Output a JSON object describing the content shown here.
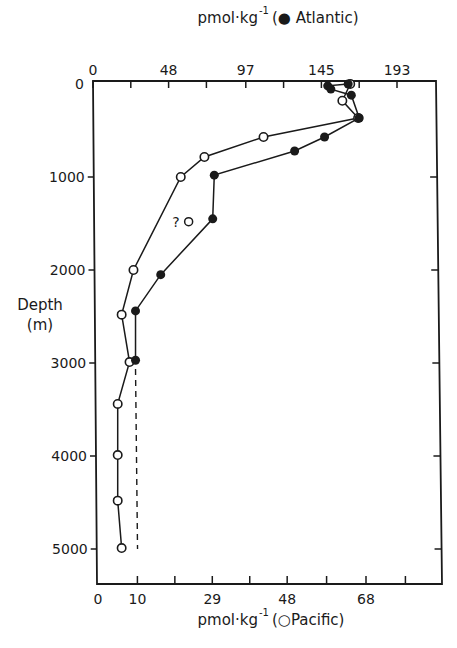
{
  "chart_data": {
    "type": "line",
    "title": "",
    "orientation": "vertical-profile",
    "top_axis": {
      "label": "pmol·kg⁻¹ (● Atlantic)",
      "label_prefix": "pmol·kg",
      "label_suffix": "(● Atlantic)",
      "ticks": [
        0,
        48,
        97,
        145,
        193
      ],
      "minor_ticks": [
        24,
        72,
        121,
        169
      ],
      "range": [
        0,
        220
      ]
    },
    "bottom_axis": {
      "label": "pmol·kg⁻¹ (○ Pacific)",
      "label_prefix": "pmol·kg",
      "label_suffix": "(○Pacific)",
      "ticks": [
        0,
        10,
        29,
        48,
        68
      ],
      "tick_positions": [
        0,
        10,
        19.5,
        29,
        38.5,
        48,
        58,
        68,
        78
      ],
      "range": [
        0,
        87
      ]
    },
    "y_axis": {
      "label": "Depth",
      "unit": "(m)",
      "ticks": [
        0,
        1000,
        2000,
        3000,
        4000,
        5000
      ],
      "range": [
        0,
        5400
      ],
      "inverted": true
    },
    "series": [
      {
        "name": "Atlantic",
        "marker": "filled-circle",
        "axis": "top",
        "points": [
          {
            "x": 162,
            "depth": 0
          },
          {
            "x": 149,
            "depth": 20
          },
          {
            "x": 151,
            "depth": 55
          },
          {
            "x": 164,
            "depth": 120
          },
          {
            "x": 169,
            "depth": 365
          },
          {
            "x": 147,
            "depth": 570
          },
          {
            "x": 128,
            "depth": 720
          },
          {
            "x": 77,
            "depth": 980
          },
          {
            "x": 76,
            "depth": 1450
          },
          {
            "x": 43,
            "depth": 2050
          },
          {
            "x": 27,
            "depth": 2440
          },
          {
            "x": 27,
            "depth": 2970
          }
        ]
      },
      {
        "name": "Pacific",
        "marker": "open-circle",
        "axis": "bottom",
        "points": [
          {
            "x": 64,
            "depth": 0
          },
          {
            "x": 62,
            "depth": 180
          },
          {
            "x": 66,
            "depth": 365
          },
          {
            "x": 42,
            "depth": 570
          },
          {
            "x": 27,
            "depth": 785
          },
          {
            "x": 21,
            "depth": 1000
          },
          {
            "x": 9,
            "depth": 2000
          },
          {
            "x": 6,
            "depth": 2480
          },
          {
            "x": 8,
            "depth": 2990
          },
          {
            "x": 5,
            "depth": 3440
          },
          {
            "x": 5,
            "depth": 3990
          },
          {
            "x": 5,
            "depth": 4480
          },
          {
            "x": 6,
            "depth": 4990
          }
        ]
      }
    ],
    "annotations": [
      {
        "text": "?",
        "marker": "open-circle",
        "series": "Pacific",
        "x": 23,
        "depth": 1480,
        "note": "questionable Pacific point"
      },
      {
        "type": "dashed-line",
        "series": "Atlantic",
        "x": 27,
        "depth_from": 3000,
        "depth_to": 5000,
        "note": "extrapolated Atlantic value"
      }
    ],
    "grid": false,
    "legend": "in axis labels"
  },
  "labels": {
    "top_axis_label": "pmol·kg",
    "top_axis_exp": "-1",
    "top_axis_series": "(● Atlantic)",
    "bottom_axis_label": "pmol·kg",
    "bottom_axis_exp": "-1",
    "bottom_axis_series": "(○Pacific)",
    "y_label": "Depth",
    "y_unit": "(m)",
    "question_mark": "?"
  }
}
